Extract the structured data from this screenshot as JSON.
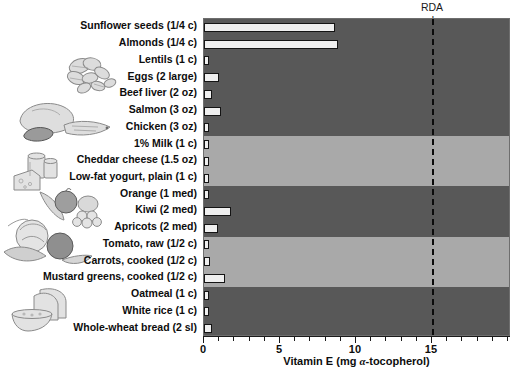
{
  "annotation": {
    "rda_line1": "RDA",
    "rda_line2": "men and women",
    "rda_value": 15
  },
  "axis": {
    "x_title_main": "Vitamin E (mg ",
    "x_title_alpha": "α",
    "x_title_tail": "-tocopherol)",
    "x_title_full": "Vitamin E (mg α-tocopherol)",
    "x_ticks": [
      0,
      5,
      10,
      15
    ],
    "x_tick_labels": [
      "0",
      "5",
      "10",
      "15"
    ],
    "x_min": 0,
    "x_max": 20.2
  },
  "colors": {
    "band_dark": "#585858",
    "band_light": "#a9a9a9",
    "bar_fill": "#efefef",
    "bar_stroke": "#141414",
    "rda_line": "#0b0b0b"
  },
  "chart_data": {
    "type": "bar",
    "orientation": "horizontal",
    "title": "",
    "xlabel": "Vitamin E (mg α-tocopherol)",
    "ylabel": "",
    "xlim": [
      0,
      20.2
    ],
    "grid": false,
    "legend": false,
    "reference_line": {
      "label": "RDA men and women",
      "value": 15
    },
    "categories": [
      "Sunflower seeds (1/4 c)",
      "Almonds (1/4 c)",
      "Lentils (1 c)",
      "Eggs (2 large)",
      "Beef liver (2 oz)",
      "Salmon (3 oz)",
      "Chicken (3 oz)",
      "1% Milk (1 c)",
      "Cheddar cheese (1.5 oz)",
      "Low-fat yogurt, plain (1 c)",
      "Orange (1 med)",
      "Kiwi (2 med)",
      "Apricots (2 med)",
      "Tomato, raw (1/2 c)",
      "Carrots, cooked (1/2 c)",
      "Mustard greens, cooked (1/2 c)",
      "Oatmeal (1 c)",
      "White rice (1 c)",
      "Whole-wheat bread (2 sl)"
    ],
    "values": [
      8.6,
      8.8,
      0.3,
      1.0,
      0.5,
      1.1,
      0.3,
      0.1,
      0.2,
      0.1,
      0.3,
      1.8,
      0.9,
      0.3,
      0.4,
      1.4,
      0.2,
      0.1,
      0.5
    ],
    "groups": [
      {
        "name": "nuts-seeds-legumes-protein",
        "shade": "dark",
        "start": 0,
        "count": 7
      },
      {
        "name": "dairy",
        "shade": "light",
        "start": 7,
        "count": 3
      },
      {
        "name": "fruits",
        "shade": "dark",
        "start": 10,
        "count": 3
      },
      {
        "name": "vegetables",
        "shade": "light",
        "start": 13,
        "count": 3
      },
      {
        "name": "grains",
        "shade": "dark",
        "start": 16,
        "count": 3
      }
    ]
  },
  "illustrations": [
    {
      "name": "nuts-seeds-illustration",
      "group": "nuts-seeds-legumes-protein"
    },
    {
      "name": "meat-fish-poultry-illustration",
      "group": "protein"
    },
    {
      "name": "dairy-illustration",
      "group": "dairy"
    },
    {
      "name": "fruit-illustration",
      "group": "fruits"
    },
    {
      "name": "vegetables-illustration",
      "group": "vegetables"
    },
    {
      "name": "grains-bread-illustration",
      "group": "grains"
    }
  ]
}
